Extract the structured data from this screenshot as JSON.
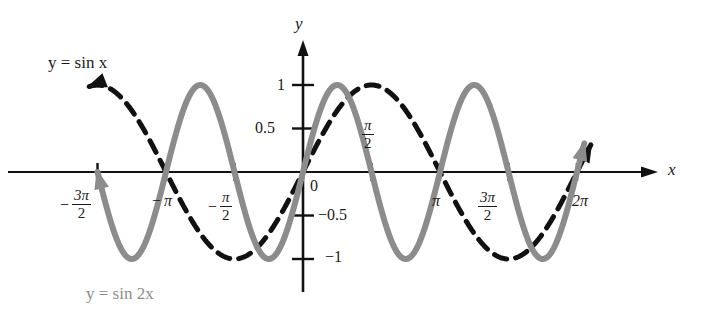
{
  "figure": {
    "background_color": "#ffffff",
    "width": 713,
    "height": 319
  },
  "axes": {
    "x_axis_name": "x",
    "y_axis_name": "y",
    "origin_label": "0",
    "axis_color": "#111111",
    "origin_px": {
      "x": 303,
      "y": 172
    },
    "px_per_half_pi": 68.5,
    "px_per_unit_y": 87,
    "x_axis_left_px": 8,
    "x_axis_right_px": 658,
    "y_axis_top_px": 40,
    "y_axis_bottom_px": 292
  },
  "x_ticks": [
    {
      "value": -4.71238898038469,
      "label_parts": {
        "negative": true,
        "numerator": "π",
        "numerator_coef": "3",
        "denominator": "2"
      },
      "label_text": "−3π/2",
      "label_px": {
        "x": 60,
        "y": 188
      }
    },
    {
      "value": -3.141592653589793,
      "label_parts": {
        "negative": true,
        "numerator": "π",
        "numerator_coef": "",
        "denominator": ""
      },
      "label_text": "−π",
      "label_px": {
        "x": 152,
        "y": 192
      }
    },
    {
      "value": -1.570796326794897,
      "label_parts": {
        "negative": true,
        "numerator": "π",
        "numerator_coef": "",
        "denominator": "2"
      },
      "label_text": "−π/2",
      "label_px": {
        "x": 208,
        "y": 190
      }
    },
    {
      "value": 1.570796326794897,
      "label_parts": {
        "negative": false,
        "numerator": "π",
        "numerator_coef": "",
        "denominator": "2"
      },
      "label_text": "π/2",
      "label_px": {
        "x": 362,
        "y": 116
      }
    },
    {
      "value": 3.141592653589793,
      "label_parts": {
        "negative": false,
        "numerator": "π",
        "numerator_coef": "",
        "denominator": ""
      },
      "label_text": "π",
      "label_px": {
        "x": 432,
        "y": 192
      }
    },
    {
      "value": 4.71238898038469,
      "label_parts": {
        "negative": false,
        "numerator": "π",
        "numerator_coef": "3",
        "denominator": "2"
      },
      "label_text": "3π/2",
      "label_px": {
        "x": 478,
        "y": 188
      }
    },
    {
      "value": 6.283185307179586,
      "label_parts": {
        "negative": false,
        "numerator": "π",
        "numerator_coef": "2",
        "denominator": ""
      },
      "label_text": "2π",
      "label_px": {
        "x": 572,
        "y": 192
      }
    }
  ],
  "y_ticks": [
    {
      "value": 1,
      "label_text": "1",
      "label_px": {
        "x": 277,
        "y": 76
      }
    },
    {
      "value": 0.5,
      "label_text": "0.5",
      "label_px": {
        "x": 255,
        "y": 119
      }
    },
    {
      "value": -0.5,
      "label_text": "−0.5",
      "label_px": {
        "x": 318,
        "y": 206
      }
    },
    {
      "value": -1,
      "label_text": "−1",
      "label_px": {
        "x": 325,
        "y": 248
      }
    }
  ],
  "curves": [
    {
      "id": "sin-x",
      "equation_label": "y = sin x",
      "expression": "sin(x)",
      "amplitude": 1,
      "frequency": 1,
      "style": "dashed",
      "color": "#111111",
      "stroke_width": 5,
      "dash_pattern": "13,9",
      "x_start": -4.9,
      "x_end": 6.6,
      "label_px": {
        "x": 48,
        "y": 53
      },
      "arrow_start": true,
      "arrow_end": true
    },
    {
      "id": "sin-2x",
      "equation_label": "y = sin 2x",
      "expression": "sin(2x)",
      "amplitude": 1,
      "frequency": 2,
      "style": "solid",
      "color": "#8c8c8c",
      "stroke_width": 6,
      "dash_pattern": "",
      "x_start": -4.71238898038469,
      "x_end": 6.45,
      "label_px": {
        "x": 86,
        "y": 284
      },
      "arrow_start": true,
      "arrow_end": true
    }
  ],
  "chart_data": {
    "type": "line",
    "xlabel": "x",
    "ylabel": "y",
    "xlim": [
      -4.9,
      6.6
    ],
    "ylim": [
      -1.15,
      1.15
    ],
    "grid": false,
    "legend": "inline-labels",
    "x_tick_values": [
      -4.71238898038469,
      -3.141592653589793,
      -1.570796326794897,
      0,
      1.570796326794897,
      3.141592653589793,
      4.71238898038469,
      6.283185307179586
    ],
    "x_tick_labels": [
      "−3π/2",
      "−π",
      "−π/2",
      "0",
      "π/2",
      "π",
      "3π/2",
      "2π"
    ],
    "y_tick_values": [
      -1,
      -0.5,
      0.5,
      1
    ],
    "y_tick_labels": [
      "−1",
      "−0.5",
      "0.5",
      "1"
    ],
    "series": [
      {
        "name": "y = sin x",
        "function": "sin(x)",
        "period": 6.283185307179586,
        "amplitude": 1,
        "linestyle": "dashed",
        "color": "#111111",
        "key_points": [
          {
            "x": -4.71238898038469,
            "y": 1
          },
          {
            "x": -3.141592653589793,
            "y": 0
          },
          {
            "x": -1.570796326794897,
            "y": -1
          },
          {
            "x": 0,
            "y": 0
          },
          {
            "x": 1.570796326794897,
            "y": 1
          },
          {
            "x": 3.141592653589793,
            "y": 0
          },
          {
            "x": 4.71238898038469,
            "y": -1
          },
          {
            "x": 6.283185307179586,
            "y": 0
          }
        ]
      },
      {
        "name": "y = sin 2x",
        "function": "sin(2x)",
        "period": 3.141592653589793,
        "amplitude": 1,
        "linestyle": "solid",
        "color": "#8c8c8c",
        "key_points": [
          {
            "x": -4.71238898038469,
            "y": 0
          },
          {
            "x": -3.926990816987241,
            "y": 1
          },
          {
            "x": -3.141592653589793,
            "y": 0
          },
          {
            "x": -2.356194490192345,
            "y": -1
          },
          {
            "x": -1.570796326794897,
            "y": 0
          },
          {
            "x": -0.785398163397448,
            "y": 1
          },
          {
            "x": 0,
            "y": 0
          },
          {
            "x": 0.785398163397448,
            "y": -1
          },
          {
            "x": 1.570796326794897,
            "y": 0
          },
          {
            "x": 2.356194490192345,
            "y": 1
          },
          {
            "x": 3.141592653589793,
            "y": 0
          },
          {
            "x": 3.926990816987241,
            "y": -1
          },
          {
            "x": 4.71238898038469,
            "y": 0
          },
          {
            "x": 5.497787143782138,
            "y": 1
          },
          {
            "x": 6.283185307179586,
            "y": 0
          }
        ]
      }
    ]
  }
}
